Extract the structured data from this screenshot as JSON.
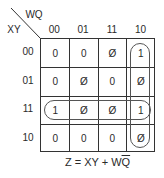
{
  "kmap": {
    "col_var": "WQ",
    "row_var": "XY",
    "columns": [
      "00",
      "01",
      "11",
      "10"
    ],
    "rows": [
      "00",
      "01",
      "11",
      "10"
    ],
    "cells": [
      [
        "0",
        "0",
        "Ø",
        "1"
      ],
      [
        "0",
        "Ø",
        "0",
        "Ø"
      ],
      [
        "1",
        "Ø",
        "Ø",
        "1"
      ],
      [
        "0",
        "0",
        "0",
        "Ø"
      ]
    ]
  },
  "formula": {
    "prefix": "Z = XY + W",
    "overbar": "Q"
  }
}
